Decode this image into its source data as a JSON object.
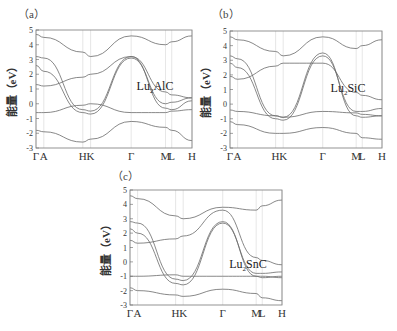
{
  "figure": {
    "ylabel": "能量（eV）",
    "y_ticks": [
      "5",
      "4",
      "3",
      "2",
      "1",
      "0",
      "-1",
      "-2",
      "-3"
    ],
    "x_ticks": [
      "Γ",
      "A",
      "H",
      "K",
      "Γ",
      "M",
      "L",
      "H"
    ]
  },
  "chart_data": [
    {
      "type": "line",
      "panel": "(a)",
      "title": "Lu2AlC",
      "xlabel": "",
      "ylabel": "能量（eV）",
      "ylim": [
        -3,
        5
      ],
      "x_ticks": [
        "Γ",
        "A",
        "H",
        "K",
        "Γ",
        "M",
        "L",
        "H"
      ],
      "x_tick_positions": [
        0,
        0.05,
        0.3,
        0.35,
        0.61,
        0.83,
        0.87,
        1.0
      ],
      "grid": false,
      "series": [
        {
          "name": "band1",
          "x": [
            0,
            0.05,
            0.3,
            0.35,
            0.61,
            0.83,
            0.87,
            1.0
          ],
          "y": [
            3.2,
            3.1,
            -0.4,
            -0.5,
            3.2,
            -0.3,
            -0.4,
            0.2
          ]
        },
        {
          "name": "band2",
          "x": [
            0,
            0.05,
            0.3,
            0.35,
            0.61,
            0.83,
            0.87,
            1.0
          ],
          "y": [
            2.6,
            2.2,
            -0.6,
            -0.7,
            3.1,
            0.0,
            0.1,
            0.4
          ]
        },
        {
          "name": "band3",
          "x": [
            0,
            0.05,
            0.3,
            0.35,
            0.61,
            0.83,
            0.87,
            1.0
          ],
          "y": [
            -0.6,
            -0.6,
            -0.1,
            0.0,
            -0.6,
            -0.6,
            -0.5,
            -0.4
          ]
        },
        {
          "name": "band4",
          "x": [
            0,
            0.05,
            0.3,
            0.35,
            0.61,
            0.83,
            0.87,
            1.0
          ],
          "y": [
            4.7,
            4.5,
            3.5,
            3.2,
            4.6,
            4.0,
            4.2,
            4.6
          ]
        },
        {
          "name": "band5",
          "x": [
            0,
            0.05,
            0.3,
            0.35,
            0.61,
            0.83,
            0.87,
            1.0
          ],
          "y": [
            -1.8,
            -1.9,
            -2.6,
            -2.4,
            -1.2,
            -1.6,
            -1.8,
            -2.5
          ]
        },
        {
          "name": "band6",
          "x": [
            0,
            0.05,
            0.3,
            0.35,
            0.61,
            0.83,
            0.87,
            1.0
          ],
          "y": [
            1.3,
            1.2,
            1.8,
            2.0,
            3.2,
            0.8,
            0.6,
            0.4
          ]
        }
      ]
    },
    {
      "type": "line",
      "panel": "(b)",
      "title": "Lu2SiC",
      "xlabel": "",
      "ylabel": "能量（eV）",
      "ylim": [
        -3,
        5
      ],
      "x_ticks": [
        "Γ",
        "A",
        "H",
        "K",
        "Γ",
        "M",
        "L",
        "H"
      ],
      "x_tick_positions": [
        0,
        0.05,
        0.3,
        0.35,
        0.61,
        0.83,
        0.87,
        1.0
      ],
      "grid": false,
      "series": [
        {
          "name": "band1",
          "x": [
            0,
            0.05,
            0.3,
            0.35,
            0.61,
            0.83,
            0.87,
            1.0
          ],
          "y": [
            3.3,
            3.1,
            -0.8,
            -0.9,
            3.5,
            -0.8,
            -0.9,
            -0.8
          ]
        },
        {
          "name": "band2",
          "x": [
            0,
            0.05,
            0.3,
            0.35,
            0.61,
            0.83,
            0.87,
            1.0
          ],
          "y": [
            2.8,
            2.5,
            -1.0,
            -1.1,
            3.3,
            -0.5,
            -0.5,
            -0.3
          ]
        },
        {
          "name": "band3",
          "x": [
            0,
            0.05,
            0.3,
            0.35,
            0.61,
            0.83,
            0.87,
            1.0
          ],
          "y": [
            -0.4,
            -0.5,
            -0.8,
            -0.9,
            -0.5,
            -0.6,
            -0.7,
            -0.8
          ]
        },
        {
          "name": "band4",
          "x": [
            0,
            0.05,
            0.3,
            0.35,
            0.61,
            0.83,
            0.87,
            1.0
          ],
          "y": [
            4.6,
            4.4,
            3.6,
            3.3,
            4.6,
            3.8,
            4.0,
            4.4
          ]
        },
        {
          "name": "band5",
          "x": [
            0,
            0.05,
            0.3,
            0.35,
            0.61,
            0.83,
            0.87,
            1.0
          ],
          "y": [
            -1.2,
            -1.4,
            -2.0,
            -2.0,
            -1.6,
            -2.0,
            -2.3,
            -2.4
          ]
        },
        {
          "name": "band6",
          "x": [
            0,
            0.05,
            0.3,
            0.35,
            0.61,
            0.83,
            0.87,
            1.0
          ],
          "y": [
            1.9,
            1.7,
            2.6,
            2.8,
            2.8,
            0.8,
            0.6,
            0.3
          ]
        }
      ]
    },
    {
      "type": "line",
      "panel": "(c)",
      "title": "Lu2SnC",
      "xlabel": "",
      "ylabel": "能量（eV）",
      "ylim": [
        -3,
        5
      ],
      "x_ticks": [
        "Γ",
        "A",
        "H",
        "K",
        "Γ",
        "M",
        "L",
        "H"
      ],
      "x_tick_positions": [
        0,
        0.05,
        0.3,
        0.35,
        0.61,
        0.83,
        0.87,
        1.0
      ],
      "grid": false,
      "series": [
        {
          "name": "band1",
          "x": [
            0,
            0.05,
            0.3,
            0.35,
            0.61,
            0.83,
            0.87,
            1.0
          ],
          "y": [
            2.8,
            2.7,
            -1.2,
            -1.3,
            2.8,
            -1.0,
            -1.1,
            -1.0
          ]
        },
        {
          "name": "band2",
          "x": [
            0,
            0.05,
            0.3,
            0.35,
            0.61,
            0.83,
            0.87,
            1.0
          ],
          "y": [
            2.3,
            2.0,
            -1.5,
            -1.6,
            2.7,
            -0.8,
            -0.8,
            -0.7
          ]
        },
        {
          "name": "band3",
          "x": [
            0,
            0.05,
            0.3,
            0.35,
            0.61,
            0.83,
            0.87,
            1.0
          ],
          "y": [
            -1.0,
            -1.0,
            -0.9,
            -1.0,
            -1.0,
            -1.0,
            -1.0,
            -1.1
          ]
        },
        {
          "name": "band4",
          "x": [
            0,
            0.05,
            0.3,
            0.35,
            0.61,
            0.83,
            0.87,
            1.0
          ],
          "y": [
            4.6,
            4.4,
            3.2,
            3.0,
            3.8,
            3.6,
            3.9,
            4.3
          ]
        },
        {
          "name": "band5",
          "x": [
            0,
            0.05,
            0.3,
            0.35,
            0.61,
            0.83,
            0.87,
            1.0
          ],
          "y": [
            -1.8,
            -2.0,
            -2.3,
            -2.4,
            -1.9,
            -2.2,
            -2.5,
            -2.7
          ]
        },
        {
          "name": "band6",
          "x": [
            0,
            0.05,
            0.3,
            0.35,
            0.61,
            0.83,
            0.87,
            1.0
          ],
          "y": [
            1.5,
            1.3,
            1.6,
            1.8,
            3.6,
            0.3,
            0.1,
            -0.2
          ]
        }
      ]
    }
  ],
  "panels": [
    {
      "label": "（a）",
      "material_base": "Lu",
      "material_sub": "2",
      "material_rest": "AlC"
    },
    {
      "label": "（b）",
      "material_base": "Lu",
      "material_sub": "2",
      "material_rest": "SiC"
    },
    {
      "label": "（c）",
      "material_base": "Lu",
      "material_sub": "2",
      "material_rest": "SnC"
    }
  ]
}
